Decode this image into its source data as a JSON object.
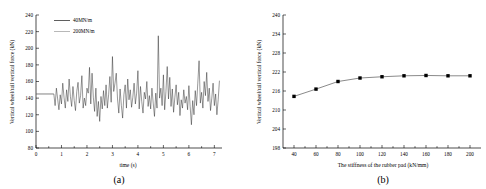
{
  "figure": {
    "panels": [
      {
        "caption": "(a)",
        "chart_data": {
          "type": "line",
          "title": "",
          "xlabel": "time (s)",
          "ylabel": "Vertical wheel/rail vertical force (kN)",
          "xlim": [
            0,
            7.3
          ],
          "ylim": [
            80,
            240
          ],
          "xticks": [
            0,
            1,
            2,
            3,
            4,
            5,
            6,
            7
          ],
          "yticks": [
            80,
            100,
            120,
            140,
            160,
            180,
            200,
            220,
            240
          ],
          "grid": false,
          "legend_position": "top-left",
          "legend": [
            "40MN/m",
            "200MN/m"
          ],
          "series": [
            {
              "name": "40MN/m",
              "color": "#1a1a1a",
              "x": [
                0.0,
                0.7,
                0.75,
                0.8,
                0.85,
                0.9,
                0.95,
                1.0,
                1.05,
                1.1,
                1.15,
                1.2,
                1.25,
                1.3,
                1.35,
                1.4,
                1.45,
                1.5,
                1.55,
                1.6,
                1.65,
                1.7,
                1.75,
                1.8,
                1.85,
                1.9,
                1.95,
                2.0,
                2.05,
                2.1,
                2.15,
                2.2,
                2.25,
                2.3,
                2.35,
                2.4,
                2.45,
                2.5,
                2.55,
                2.6,
                2.65,
                2.7,
                2.75,
                2.8,
                2.85,
                2.9,
                2.95,
                3.0,
                3.05,
                3.1,
                3.15,
                3.2,
                3.25,
                3.3,
                3.35,
                3.4,
                3.45,
                3.5,
                3.55,
                3.6,
                3.65,
                3.7,
                3.75,
                3.8,
                3.85,
                3.9,
                3.95,
                4.0,
                4.05,
                4.1,
                4.15,
                4.2,
                4.25,
                4.3,
                4.35,
                4.4,
                4.45,
                4.5,
                4.55,
                4.6,
                4.65,
                4.7,
                4.75,
                4.8,
                4.85,
                4.9,
                4.95,
                5.0,
                5.05,
                5.1,
                5.15,
                5.2,
                5.25,
                5.3,
                5.35,
                5.4,
                5.45,
                5.5,
                5.55,
                5.6,
                5.65,
                5.7,
                5.75,
                5.8,
                5.85,
                5.9,
                5.95,
                6.0,
                6.05,
                6.1,
                6.15,
                6.2,
                6.25,
                6.3,
                6.35,
                6.4,
                6.45,
                6.5,
                6.55,
                6.6,
                6.65,
                6.7,
                6.75,
                6.8,
                6.85,
                6.9,
                6.95,
                7.0,
                7.05,
                7.1,
                7.15,
                7.2
              ],
              "y": [
                145,
                145,
                131,
                152,
                139,
                126,
                144,
                133,
                158,
                141,
                128,
                150,
                136,
                163,
                142,
                130,
                154,
                137,
                125,
                148,
                159,
                134,
                143,
                167,
                128,
                140,
                131,
                152,
                146,
                177,
                133,
                170,
                141,
                124,
                152,
                118,
                136,
                112,
                142,
                127,
                149,
                131,
                156,
                128,
                144,
                166,
                135,
                190,
                148,
                158,
                170,
                139,
                122,
                151,
                131,
                116,
                144,
                156,
                128,
                163,
                138,
                150,
                129,
                141,
                158,
                133,
                146,
                173,
                127,
                154,
                136,
                122,
                147,
                139,
                160,
                130,
                143,
                127,
                152,
                134,
                118,
                146,
                128,
                215,
                140,
                152,
                131,
                168,
                126,
                148,
                178,
                139,
                165,
                130,
                151,
                123,
                141,
                156,
                132,
                147,
                119,
                138,
                128,
                150,
                134,
                142,
                126,
                155,
                130,
                108,
                137,
                120,
                149,
                131,
                158,
                185,
                134,
                147,
                128,
                160,
                143,
                171,
                136,
                152,
                125,
                140,
                158,
                131,
                145,
                120,
                138,
                161
              ]
            },
            {
              "name": "200MN/m",
              "color": "#9a9a9a",
              "x": [
                0.0,
                0.7
              ],
              "y": [
                145,
                145
              ]
            }
          ]
        }
      },
      {
        "caption": "(b)",
        "chart_data": {
          "type": "line",
          "title": "",
          "xlabel": "The stiffness of the rubber pad (kN/mm)",
          "ylabel": "Vertical wheel/rail vertical force (kN)",
          "xlim": [
            30,
            210
          ],
          "ylim": [
            198,
            240
          ],
          "xticks": [
            40,
            60,
            80,
            100,
            120,
            140,
            160,
            180,
            200
          ],
          "yticks": [
            198,
            204,
            210,
            216,
            222,
            228,
            234,
            240
          ],
          "grid": false,
          "markers": "square",
          "series": [
            {
              "name": "vertical force vs rubber pad stiffness",
              "color": "#3a3a3a",
              "x": [
                40,
                60,
                80,
                100,
                120,
                140,
                160,
                180,
                200
              ],
              "y": [
                214.3,
                216.6,
                219.0,
                220.1,
                220.5,
                220.8,
                220.9,
                220.8,
                220.8
              ]
            }
          ]
        }
      }
    ]
  }
}
